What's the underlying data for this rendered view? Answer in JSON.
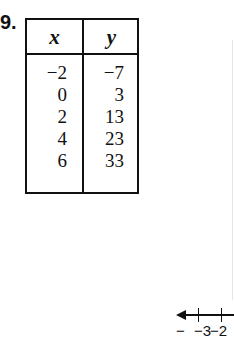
{
  "problem": {
    "number": "9."
  },
  "table": {
    "headers": [
      "x",
      "y"
    ],
    "rows": [
      {
        "x": "−2",
        "y": "−7"
      },
      {
        "x": "0",
        "y": "3"
      },
      {
        "x": "2",
        "y": "13"
      },
      {
        "x": "4",
        "y": "23"
      },
      {
        "x": "6",
        "y": "33"
      }
    ]
  },
  "number_line": {
    "tick_labels": [
      "−3",
      "−2"
    ],
    "left_dash": "−",
    "mid_dash": "−"
  }
}
